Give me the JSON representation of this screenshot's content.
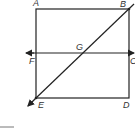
{
  "diagram": {
    "type": "geometry",
    "colors": {
      "stroke": "#222222",
      "label": "#333333",
      "background": "#ffffff"
    },
    "points": {
      "A": {
        "label": "A",
        "x": 36,
        "y": 9
      },
      "B": {
        "label": "B",
        "x": 129,
        "y": 9
      },
      "C": {
        "label": "C",
        "x": 129,
        "y": 53
      },
      "D": {
        "label": "D",
        "x": 129,
        "y": 98
      },
      "E": {
        "label": "E",
        "x": 36,
        "y": 98
      },
      "F": {
        "label": "F",
        "x": 36,
        "y": 53
      },
      "G": {
        "label": "G",
        "x": 82,
        "y": 53
      }
    },
    "shapes": [
      {
        "kind": "square",
        "vertices": [
          "A",
          "B",
          "D",
          "E"
        ]
      },
      {
        "kind": "line",
        "through": [
          "F",
          "C"
        ],
        "arrows": "both"
      },
      {
        "kind": "line",
        "through": [
          "E",
          "B"
        ],
        "arrows": "both",
        "intersects_at": "G"
      }
    ]
  }
}
